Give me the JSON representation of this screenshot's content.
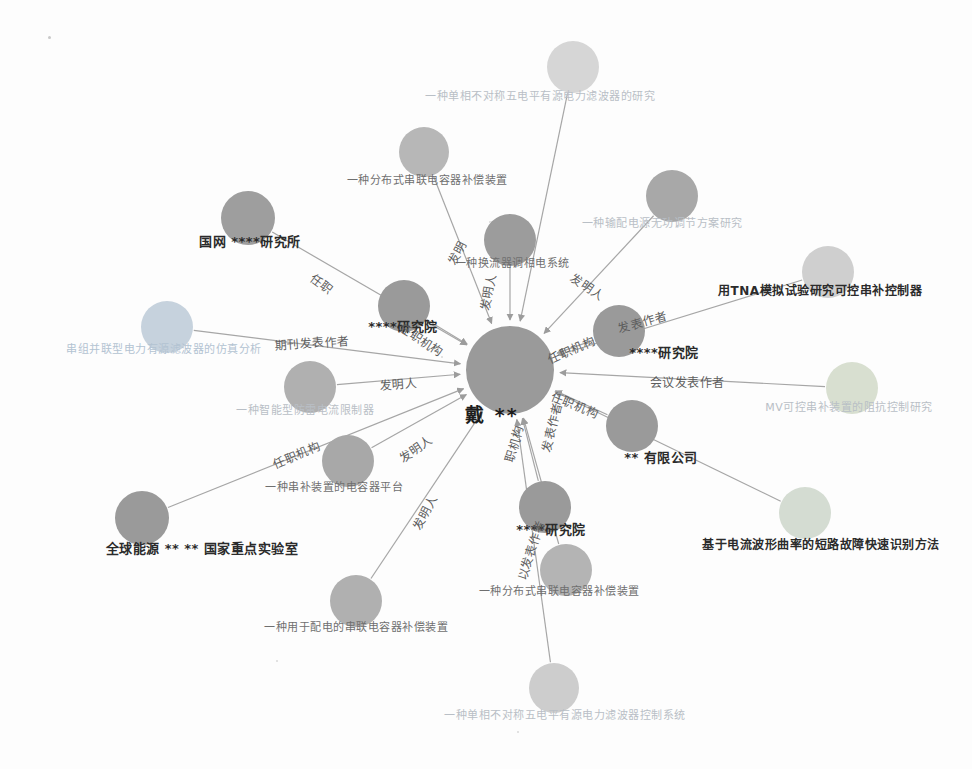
{
  "canvas": {
    "width": 972,
    "height": 769,
    "background": "#fdfdfd"
  },
  "graph": {
    "type": "knowledge-graph",
    "center": {
      "label": "戴 **",
      "x": 510,
      "y": 370,
      "radius": 44,
      "color": "#9a9a9a",
      "label_x": 492,
      "label_y": 413
    },
    "nodes": [
      {
        "id": "n1",
        "label": "一种单相不对称五电平有源电力滤波器的研究",
        "x": 573,
        "y": 67,
        "r": 26,
        "color": "#d6d6d6",
        "label_x": 540,
        "label_y": 97,
        "label_class": "lbl-faint",
        "font_size": 11
      },
      {
        "id": "n2",
        "label": "一种分布式串联电容器补偿装置",
        "x": 424,
        "y": 152,
        "r": 25,
        "color": "#b7b7b7",
        "label_x": 427,
        "label_y": 181,
        "label_class": "lbl-mid",
        "font_size": 11
      },
      {
        "id": "n3",
        "label": "一种输配电源无功调节方案研究",
        "x": 672,
        "y": 196,
        "r": 26,
        "color": "#a8a8a8",
        "label_x": 662,
        "label_y": 224,
        "label_class": "lbl-faint",
        "font_size": 11
      },
      {
        "id": "n4",
        "label": "国网 ****研究所",
        "x": 248,
        "y": 218,
        "r": 27,
        "color": "#9e9e9e",
        "label_x": 250,
        "label_y": 242,
        "label_class": "lbl-dark",
        "font_size": 13
      },
      {
        "id": "n5",
        "label": "一种换流器调相电系统",
        "x": 510,
        "y": 240,
        "r": 26,
        "color": "#9c9c9c",
        "label_x": 512,
        "label_y": 264,
        "label_class": "lbl-mid",
        "font_size": 11
      },
      {
        "id": "n6",
        "label": "用TNA模拟试验研究可控串补控制器",
        "x": 828,
        "y": 272,
        "r": 26,
        "color": "#cfcfcf",
        "label_x": 820,
        "label_y": 292,
        "label_class": "lbl-dark",
        "font_size": 12
      },
      {
        "id": "n7",
        "label": "****研究院",
        "x": 404,
        "y": 306,
        "r": 26,
        "color": "#9a9a9a",
        "label_x": 403,
        "label_y": 327,
        "label_class": "lbl-dark",
        "font_size": 13
      },
      {
        "id": "n8",
        "label": "串组并联型电力有源滤波器的仿真分析",
        "x": 167,
        "y": 327,
        "r": 26,
        "color": "#c6d2dd",
        "label_x": 164,
        "label_y": 350,
        "label_class": "lbl-faintblue",
        "font_size": 11
      },
      {
        "id": "n9",
        "label": "****研究院",
        "x": 619,
        "y": 331,
        "r": 26,
        "color": "#9a9a9a",
        "label_x": 664,
        "label_y": 353,
        "label_class": "lbl-dark",
        "font_size": 13
      },
      {
        "id": "n10",
        "label": "一种智能型防雷电流限制器",
        "x": 310,
        "y": 387,
        "r": 26,
        "color": "#b0b0b0",
        "label_x": 305,
        "label_y": 411,
        "label_class": "lbl-faint",
        "font_size": 11
      },
      {
        "id": "n11",
        "label": "MV可控串补装置的阻抗控制研究",
        "x": 852,
        "y": 388,
        "r": 26,
        "color": "#d8dfd0",
        "label_x": 849,
        "label_y": 408,
        "label_class": "lbl-faint",
        "font_size": 11
      },
      {
        "id": "n12",
        "label": "** 有限公司",
        "x": 632,
        "y": 426,
        "r": 26,
        "color": "#9a9a9a",
        "label_x": 661,
        "label_y": 458,
        "label_class": "lbl-dark",
        "font_size": 13
      },
      {
        "id": "n13",
        "label": "一种串补装置的电容器平台",
        "x": 348,
        "y": 461,
        "r": 26,
        "color": "#a8a8a8",
        "label_x": 334,
        "label_y": 488,
        "label_class": "lbl-mid",
        "font_size": 11
      },
      {
        "id": "n14",
        "label": "****研究院",
        "x": 545,
        "y": 507,
        "r": 26,
        "color": "#9a9a9a",
        "label_x": 551,
        "label_y": 530,
        "label_class": "lbl-dark",
        "font_size": 13
      },
      {
        "id": "n15",
        "label": "全球能源 ** ** 国家重点实验室",
        "x": 142,
        "y": 518,
        "r": 27,
        "color": "#9a9a9a",
        "label_x": 202,
        "label_y": 549,
        "label_class": "lbl-dark",
        "font_size": 13
      },
      {
        "id": "n16",
        "label": "基于电流波形曲率的短路故障快速识别方法",
        "x": 805,
        "y": 513,
        "r": 26,
        "color": "#d4dcd2",
        "label_x": 821,
        "label_y": 546,
        "label_class": "lbl-dark",
        "font_size": 12
      },
      {
        "id": "n17",
        "label": "一种分布式串联电容器补偿装置",
        "x": 566,
        "y": 570,
        "r": 26,
        "color": "#b4b4b4",
        "label_x": 559,
        "label_y": 592,
        "label_class": "lbl-mid",
        "font_size": 11
      },
      {
        "id": "n18",
        "label": "一种用于配电的串联电容器补偿装置",
        "x": 356,
        "y": 601,
        "r": 26,
        "color": "#b0b0b0",
        "label_x": 356,
        "label_y": 628,
        "label_class": "lbl-mid",
        "font_size": 11
      },
      {
        "id": "n19",
        "label": "一种单相不对称五电平有源电力滤波器控制系统",
        "x": 554,
        "y": 688,
        "r": 25,
        "color": "#cdcdcd",
        "label_x": 565,
        "label_y": 716,
        "label_class": "lbl-faint",
        "font_size": 11
      }
    ],
    "edges": [
      {
        "source": "n1",
        "target": "center",
        "label": "",
        "label_x": 0,
        "label_y": 0,
        "angle": 0
      },
      {
        "source": "n2",
        "target": "center",
        "label": "发明",
        "label_x": 456,
        "label_y": 252,
        "angle": -62
      },
      {
        "source": "n3",
        "target": "center",
        "label": "发明人",
        "label_x": 588,
        "label_y": 286,
        "angle": 34
      },
      {
        "source": "n4",
        "target": "center",
        "label": "任职",
        "label_x": 322,
        "label_y": 283,
        "angle": 38
      },
      {
        "source": "n5",
        "target": "center",
        "label": "发明人",
        "label_x": 487,
        "label_y": 292,
        "angle": -80
      },
      {
        "source": "n6",
        "target": "center",
        "label": "发表作者",
        "label_x": 642,
        "label_y": 321,
        "angle": -16
      },
      {
        "source": "n7",
        "target": "center",
        "label": "任职机构",
        "label_x": 422,
        "label_y": 339,
        "angle": 33
      },
      {
        "source": "n8",
        "target": "center",
        "label": "期刊发表作者",
        "label_x": 312,
        "label_y": 342,
        "angle": -4
      },
      {
        "source": "n9",
        "target": "center",
        "label": "任职机构",
        "label_x": 571,
        "label_y": 349,
        "angle": -24
      },
      {
        "source": "n10",
        "target": "center",
        "label": "发明人",
        "label_x": 398,
        "label_y": 383,
        "angle": -4
      },
      {
        "source": "n11",
        "target": "center",
        "label": "会议发表作者",
        "label_x": 687,
        "label_y": 381,
        "angle": 0
      },
      {
        "source": "n12",
        "target": "center",
        "label": "任职机构",
        "label_x": 575,
        "label_y": 404,
        "angle": 22
      },
      {
        "source": "n13",
        "target": "center",
        "label": "任职机构",
        "label_x": 296,
        "label_y": 454,
        "angle": -23
      },
      {
        "source": "n14",
        "target": "center",
        "label": "职机构",
        "label_x": 513,
        "label_y": 443,
        "angle": -74
      },
      {
        "source": "n15",
        "target": "center",
        "label": "发明人",
        "label_x": 415,
        "label_y": 448,
        "angle": -34
      },
      {
        "source": "n16",
        "target": "center",
        "label": "发表作者",
        "label_x": 551,
        "label_y": 427,
        "angle": -76
      },
      {
        "source": "n17",
        "target": "center",
        "label": "以发表作者",
        "label_x": 530,
        "label_y": 550,
        "angle": -72
      },
      {
        "source": "n18",
        "target": "center",
        "label": "发明人",
        "label_x": 424,
        "label_y": 512,
        "angle": -63
      },
      {
        "source": "n19",
        "target": "center",
        "label": "",
        "label_x": 0,
        "label_y": 0,
        "angle": 0
      }
    ],
    "colors": {
      "edge_stroke": "#a6a6a6",
      "node_default": "#9a9a9a",
      "label_dark": "#2b2b2b",
      "label_mid": "#6f6f6f",
      "label_faint": "#b9bfc6"
    }
  }
}
